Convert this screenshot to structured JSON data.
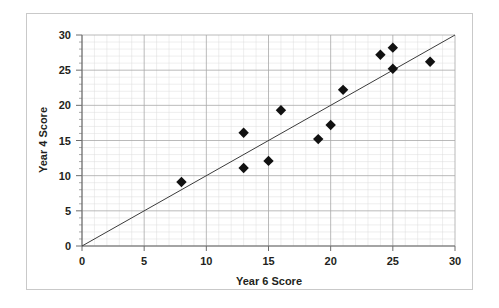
{
  "chart_data": {
    "type": "scatter",
    "title": "",
    "subtitle": "",
    "xlabel": "Year 6 Score",
    "ylabel": "Year 4 Score",
    "xlim": [
      0,
      30
    ],
    "ylim": [
      0,
      30
    ],
    "xticks": [
      0,
      5,
      10,
      15,
      20,
      25,
      30
    ],
    "yticks": [
      0,
      5,
      10,
      15,
      20,
      25,
      30
    ],
    "xtick_labels": [
      "0",
      "5",
      "10",
      "15",
      "20",
      "25",
      "30"
    ],
    "ytick_labels": [
      "0",
      "5",
      "10",
      "15",
      "20",
      "25",
      "30"
    ],
    "grid": true,
    "grid_major_step": 5,
    "grid_minor_step": 1,
    "legend": false,
    "legend_position": "none",
    "marker_shape": "diamond",
    "marker_color": "#111111",
    "series": [
      {
        "name": "Pupil scores",
        "points": [
          {
            "x": 8,
            "y": 9.1
          },
          {
            "x": 13,
            "y": 16.1
          },
          {
            "x": 13,
            "y": 11.1
          },
          {
            "x": 15,
            "y": 12.1
          },
          {
            "x": 16,
            "y": 19.3
          },
          {
            "x": 19,
            "y": 15.2
          },
          {
            "x": 20,
            "y": 17.2
          },
          {
            "x": 21,
            "y": 22.2
          },
          {
            "x": 24,
            "y": 27.2
          },
          {
            "x": 25,
            "y": 28.2
          },
          {
            "x": 25,
            "y": 25.2
          },
          {
            "x": 28,
            "y": 26.2
          }
        ]
      }
    ],
    "trendline": {
      "name": "y = x reference line",
      "type": "line",
      "x_start": 0,
      "y_start": 0,
      "x_end": 30,
      "y_end": 30,
      "color": "#3b3b3b"
    },
    "colors": {
      "marker": "#111111",
      "trendline": "#3b3b3b",
      "axis": "#6d6d6d",
      "grid_major": "#a8a8a8",
      "grid_minor": "#dcdcdc",
      "text": "#231f20",
      "frame": "#c9c9c9",
      "background": "#ffffff"
    }
  }
}
